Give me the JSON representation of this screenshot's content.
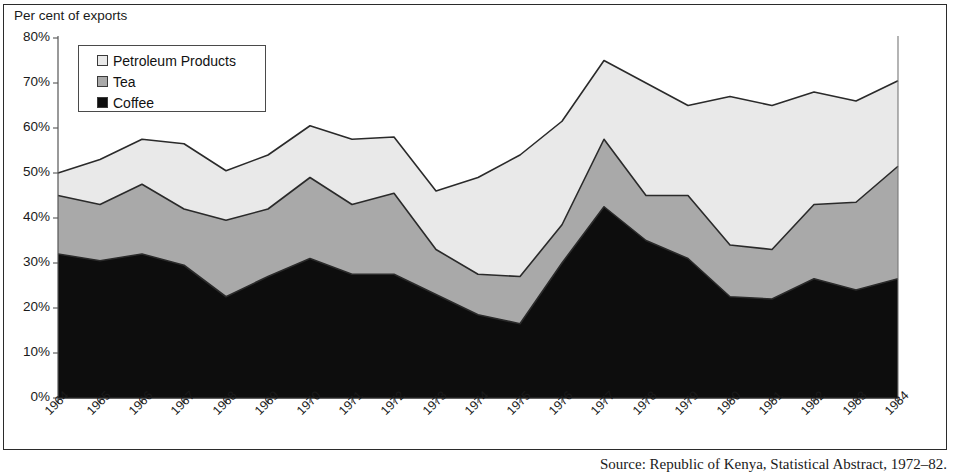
{
  "figure": {
    "axis_title": "Per cent of exports",
    "caption": "Source: Republic of Kenya, Statistical Abstract, 1972–82."
  },
  "legend": {
    "position": "top-left-inside",
    "items": [
      {
        "label": "Petroleum Products",
        "color": "#e9e9e9",
        "name": "petroleum-products"
      },
      {
        "label": "Tea",
        "color": "#a9a9a9",
        "name": "tea"
      },
      {
        "label": "Coffee",
        "color": "#0d0d0d",
        "name": "coffee"
      }
    ]
  },
  "chart_data": {
    "type": "area",
    "stacked": true,
    "title": "",
    "subtitle": "",
    "xlabel": "",
    "ylabel": "Per cent of exports",
    "ylim": [
      0,
      80
    ],
    "yticks": [
      0,
      10,
      20,
      30,
      40,
      50,
      60,
      70,
      80
    ],
    "ytick_labels": [
      "0%",
      "10%",
      "20%",
      "30%",
      "40%",
      "50%",
      "60%",
      "70%",
      "80%"
    ],
    "grid": false,
    "legend_position": "upper left",
    "categories": [
      "1964",
      "1965",
      "1966",
      "1967",
      "1968",
      "1969",
      "1970",
      "1971",
      "1972",
      "1973",
      "1974",
      "1975",
      "1976",
      "1977",
      "1978",
      "1979",
      "1980",
      "1981",
      "1982",
      "1983",
      "1984"
    ],
    "series": [
      {
        "name": "Coffee",
        "color": "#0d0d0d",
        "values": [
          32,
          30.5,
          32,
          29.5,
          22.5,
          27,
          31,
          27.5,
          27.5,
          23,
          18.5,
          16.5,
          30,
          42.5,
          35,
          31,
          22.5,
          22,
          26.5,
          24,
          26.5
        ]
      },
      {
        "name": "Tea",
        "color": "#a9a9a9",
        "values": [
          13,
          12.5,
          15.5,
          12.5,
          17,
          15,
          18,
          15.5,
          18,
          10,
          9,
          10.5,
          8.5,
          15,
          10,
          14,
          11.5,
          11,
          16.5,
          19.5,
          25
        ]
      },
      {
        "name": "Petroleum Products",
        "color": "#e9e9e9",
        "values": [
          5,
          10,
          10,
          14.5,
          11,
          12,
          11.5,
          14.5,
          12.5,
          13,
          21.5,
          27,
          23,
          17.5,
          25,
          20,
          33,
          32,
          25,
          22.5,
          19
        ]
      }
    ],
    "cumulative_tops": {
      "coffee": [
        32,
        30.5,
        32,
        29.5,
        22.5,
        27,
        31,
        27.5,
        27.5,
        23,
        18.5,
        16.5,
        30,
        42.5,
        35,
        31,
        22.5,
        22,
        26.5,
        24,
        26.5
      ],
      "tea": [
        45,
        43,
        47.5,
        42,
        39.5,
        42,
        49,
        43,
        45.5,
        33,
        27.5,
        27,
        38.5,
        57.5,
        45,
        45,
        34,
        33,
        43,
        43.5,
        51.5
      ],
      "petroleum": [
        50,
        53,
        57.5,
        56.5,
        50.5,
        54,
        60.5,
        57.5,
        58,
        46,
        49,
        54,
        61.5,
        75,
        70,
        65,
        67,
        65,
        68,
        66,
        70.5
      ]
    }
  }
}
